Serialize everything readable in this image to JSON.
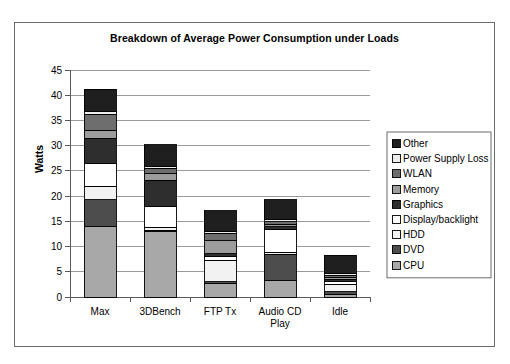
{
  "chart_data": {
    "type": "bar",
    "variant": "stacked-vertical",
    "title": "Breakdown of Average Power Consumption under Loads",
    "xlabel": "",
    "ylabel": "Watts",
    "ylim": [
      0,
      45
    ],
    "ytick_step": 5,
    "yticks": [
      "0",
      "5",
      "10",
      "15",
      "20",
      "25",
      "30",
      "35",
      "40",
      "45"
    ],
    "grid": true,
    "legend_position": "right",
    "legend_order": "reversed",
    "categories": [
      "Max",
      "3DBench",
      "FTP Tx",
      "Audio CD Play",
      "Idle"
    ],
    "category_labels": [
      [
        "Max"
      ],
      [
        "3DBench"
      ],
      [
        "FTP Tx"
      ],
      [
        "Audio CD",
        "Play"
      ],
      [
        "Idle"
      ]
    ],
    "series": [
      {
        "name": "CPU",
        "color": "#a8a8a8",
        "values": [
          13.9,
          12.9,
          2.6,
          3.2,
          0.5
        ]
      },
      {
        "name": "DVD",
        "color": "#4d4d4d",
        "values": [
          5.4,
          0.3,
          0.4,
          5.3,
          0.5
        ]
      },
      {
        "name": "HDD",
        "color": "#f2f2f2",
        "values": [
          2.7,
          0.6,
          4.3,
          0.4,
          1.5
        ]
      },
      {
        "name": "Display/backlight",
        "color": "#ffffff",
        "values": [
          4.4,
          4.1,
          0.7,
          4.4,
          0.5
        ]
      },
      {
        "name": "Graphics",
        "color": "#2e2e2e",
        "values": [
          5.1,
          5.2,
          0.6,
          0.6,
          0.5
        ]
      },
      {
        "name": "Memory",
        "color": "#9c9c9c",
        "values": [
          1.6,
          1.3,
          2.6,
          0.5,
          0.4
        ]
      },
      {
        "name": "WLAN",
        "color": "#6e6e6e",
        "values": [
          3.1,
          1.1,
          1.4,
          0.5,
          0.4
        ]
      },
      {
        "name": "Power Supply Loss",
        "color": "#ededed",
        "values": [
          0.5,
          0.4,
          0.4,
          0.4,
          0.4
        ]
      },
      {
        "name": "Other",
        "color": "#1f1f1f",
        "values": [
          4.5,
          4.3,
          4.1,
          4.0,
          3.6
        ]
      }
    ],
    "totals": [
      41.2,
      30.2,
      17.1,
      19.3,
      8.3
    ]
  }
}
